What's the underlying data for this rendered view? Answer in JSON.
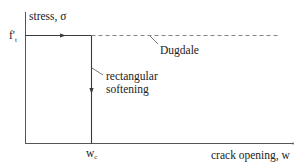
{
  "diagram": {
    "y_axis_label": "stress, σ",
    "x_axis_label": "crack opening, w",
    "y_tick_label": "f't",
    "y_tick_main": "f'",
    "y_tick_sub": "t",
    "x_tick_label": "wc",
    "x_tick_main": "w",
    "x_tick_sub": "c",
    "annotations": {
      "dugdale": "Dugdale",
      "rectangular_line1": "rectangular",
      "rectangular_line2": "softening"
    },
    "colors": {
      "line": "#3a3a3a",
      "dashed": "#777777",
      "text": "#222222",
      "background": "#ffffff"
    }
  }
}
